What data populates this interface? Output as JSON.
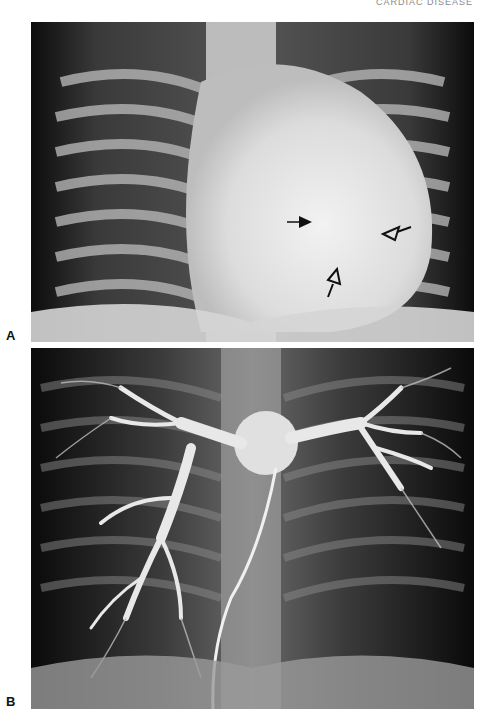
{
  "header": {
    "running_text": "CARDIAC DISEASE"
  },
  "panels": [
    {
      "label": "A",
      "description": "Frontal chest radiograph showing enlarged cardiac silhouette",
      "annotations": [
        {
          "type": "solid-arrow",
          "x": 297,
          "y": 222,
          "direction": "right"
        },
        {
          "type": "open-arrowhead",
          "x": 390,
          "y": 233,
          "direction": "left"
        },
        {
          "type": "open-arrowhead",
          "x": 330,
          "y": 287,
          "direction": "up"
        }
      ]
    },
    {
      "label": "B",
      "description": "Pulmonary angiogram with catheter showing branching pulmonary arteries"
    }
  ],
  "colors": {
    "background": "#ffffff",
    "film_dark": "#1e1e1e",
    "bone_light": "#e6e6e6"
  }
}
